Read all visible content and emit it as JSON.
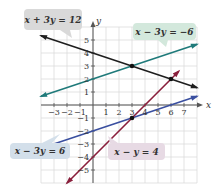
{
  "chart_data": {
    "type": "line",
    "title": "",
    "xlabel": "x",
    "ylabel": "y",
    "xlim": [
      -4,
      8
    ],
    "ylim": [
      -6,
      6
    ],
    "grid": true,
    "x_ticks": [
      "-3",
      "-2",
      "-1",
      "1",
      "2",
      "3",
      "4",
      "5",
      "6",
      "7"
    ],
    "y_ticks": [
      "5",
      "4",
      "3",
      "2",
      "1",
      "-1",
      "-2",
      "-3",
      "-4",
      "-5"
    ],
    "series": [
      {
        "name": "x + 3y = 12",
        "color": "#1e1e1e",
        "slope": -0.3333,
        "intercept": 4,
        "points": [
          [
            -4,
            5.33
          ],
          [
            8,
            1.33
          ]
        ],
        "label_bg": "#d9d9d9"
      },
      {
        "name": "x − 3y = −6",
        "color": "#1f7a7a",
        "slope": 0.3333,
        "intercept": 2,
        "points": [
          [
            -4,
            0.67
          ],
          [
            8,
            4.67
          ]
        ],
        "label_bg": "#d3e8dc"
      },
      {
        "name": "x − 3y = 6",
        "color": "#3a4fa0",
        "slope": 0.3333,
        "intercept": -2,
        "points": [
          [
            -4,
            -3.33
          ],
          [
            8,
            0.67
          ]
        ],
        "label_bg": "#d3dfea"
      },
      {
        "name": "x − y = 4",
        "color": "#8a1f3c",
        "slope": 1,
        "intercept": -4,
        "points": [
          [
            -2,
            -6
          ],
          [
            6.6,
            2.6
          ]
        ],
        "label_bg": "#e7dae4"
      }
    ],
    "intersection_points": [
      [
        3,
        3
      ],
      [
        6,
        2
      ],
      [
        3,
        -1
      ]
    ]
  },
  "labels": {
    "eq1": "x + 3y = 12",
    "eq2": "x − 3y = −6",
    "eq3": "x − 3y = 6",
    "eq4": "x − y = 4"
  },
  "axes": {
    "x": "x",
    "y": "y"
  }
}
